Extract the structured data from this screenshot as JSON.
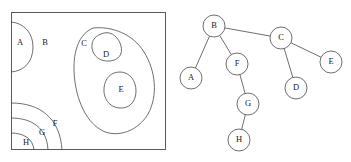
{
  "figure": {
    "width": 351,
    "height": 162,
    "background_color": "#ffffff",
    "stroke_color": "#4a4a4a",
    "frame_color": "#5a5a5a",
    "label_color": "#1a1a1a"
  },
  "left_panel": {
    "title": "",
    "frame": {
      "x": 11,
      "y": 12,
      "width": 155,
      "height": 138
    },
    "regions": [
      {
        "id": "A",
        "label": "A",
        "label_x": 20,
        "label_y": 43,
        "shape": "half-oval-bulge-on-left-edge",
        "path": "M 11 22 C 24 23 33 33 33 47 C 33 62 24 71 11 72"
      },
      {
        "id": "B",
        "label": "B",
        "label_x": 45,
        "label_y": 43,
        "shape": "ambient-background-region",
        "path": ""
      },
      {
        "id": "C",
        "label": "C",
        "label_x": 84,
        "label_y": 44,
        "shape": "large-blob",
        "path": "M 93 28 C 112 26 133 34 144 52 C 156 71 158 96 148 114 C 138 131 118 138 103 131 C 87 123 78 103 75 82 C 72 60 75 36 93 28 Z"
      },
      {
        "id": "D",
        "label": "D",
        "label_x": 106,
        "label_y": 55,
        "shape": "small-irregular-blob",
        "path": "M 104 33 C 112 31 119 38 121 46 C 123 54 119 60 110 61 C 100 62 93 56 92 48 C 91 40 96 35 104 33 Z"
      },
      {
        "id": "E",
        "label": "E",
        "label_x": 121,
        "label_y": 90,
        "shape": "oval",
        "path": "M 120 72 C 130 72 136 81 136 91 C 136 102 129 109 119 108 C 109 107 103 98 104 88 C 105 78 111 72 120 72 Z"
      },
      {
        "id": "F",
        "label": "F",
        "label_x": 55,
        "label_y": 124,
        "shape": "rounded-corner-arc-bottom-left",
        "path": "M 11 103 C 40 103 60 118 62 150"
      },
      {
        "id": "G",
        "label": "G",
        "label_x": 42,
        "label_y": 133,
        "shape": "rounded-corner-arc-bottom-left",
        "path": "M 11 118 C 32 118 47 128 48 150"
      },
      {
        "id": "H",
        "label": "H",
        "label_x": 26,
        "label_y": 143,
        "shape": "rounded-corner-arc-bottom-left",
        "path": "M 11 133 C 24 133 33 139 34 150"
      }
    ]
  },
  "right_panel": {
    "title": "",
    "node_radius": 11,
    "nodes": [
      {
        "id": "B",
        "label": "B",
        "x": 214,
        "y": 26
      },
      {
        "id": "C",
        "label": "C",
        "x": 281,
        "y": 38
      },
      {
        "id": "A",
        "label": "A",
        "x": 191,
        "y": 78
      },
      {
        "id": "F",
        "label": "F",
        "x": 237,
        "y": 64
      },
      {
        "id": "E",
        "label": "E",
        "x": 331,
        "y": 62
      },
      {
        "id": "D",
        "label": "D",
        "x": 296,
        "y": 88
      },
      {
        "id": "G",
        "label": "G",
        "x": 248,
        "y": 104
      },
      {
        "id": "H",
        "label": "H",
        "x": 239,
        "y": 140
      }
    ],
    "edges": [
      {
        "from": "B",
        "to": "C"
      },
      {
        "from": "B",
        "to": "A"
      },
      {
        "from": "B",
        "to": "F"
      },
      {
        "from": "C",
        "to": "E"
      },
      {
        "from": "C",
        "to": "D"
      },
      {
        "from": "F",
        "to": "G"
      },
      {
        "from": "G",
        "to": "H"
      }
    ]
  }
}
